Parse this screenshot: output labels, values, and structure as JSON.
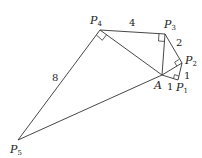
{
  "diagram": {
    "type": "geometry-spiral-of-right-triangles",
    "points": {
      "A": {
        "label": "A",
        "sub": "",
        "x": 162,
        "y": 75
      },
      "P1": {
        "label": "P",
        "sub": "1",
        "x": 178,
        "y": 80
      },
      "P2": {
        "label": "P",
        "sub": "2",
        "x": 182,
        "y": 63
      },
      "P3": {
        "label": "P",
        "sub": "3",
        "x": 165,
        "y": 34
      },
      "P4": {
        "label": "P",
        "sub": "4",
        "x": 100,
        "y": 30
      },
      "P5": {
        "label": "P",
        "sub": "5",
        "x": 18,
        "y": 140
      }
    },
    "edge_labels": {
      "AP1": "1",
      "P1P2": "1",
      "P2P3": "2",
      "P3P4": "4",
      "P4P5": "8"
    },
    "right_angles_at": [
      "P1",
      "P2",
      "P3",
      "P4"
    ]
  }
}
